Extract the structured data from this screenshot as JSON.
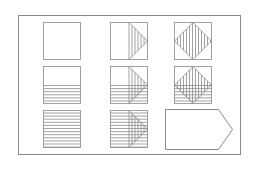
{
  "diagram": {
    "type": "pattern-matrix-puzzle",
    "stroke_color": "#8a8a8a",
    "frame": {
      "x": 18,
      "y": 15,
      "w": 222,
      "h": 139
    },
    "cells": [
      {
        "row": 0,
        "col": 0,
        "x": 43,
        "y": 22,
        "size": 37,
        "horizontal_lines": "none",
        "overlay": "none"
      },
      {
        "row": 0,
        "col": 1,
        "x": 110,
        "y": 22,
        "size": 37,
        "horizontal_lines": "none",
        "overlay": "triangle-right"
      },
      {
        "row": 0,
        "col": 2,
        "x": 174,
        "y": 22,
        "size": 37,
        "horizontal_lines": "none",
        "overlay": "diamond"
      },
      {
        "row": 1,
        "col": 0,
        "x": 43,
        "y": 66,
        "size": 37,
        "horizontal_lines": "bottom-half",
        "overlay": "none"
      },
      {
        "row": 1,
        "col": 1,
        "x": 110,
        "y": 66,
        "size": 37,
        "horizontal_lines": "bottom-half",
        "overlay": "triangle-right"
      },
      {
        "row": 1,
        "col": 2,
        "x": 174,
        "y": 66,
        "size": 37,
        "horizontal_lines": "bottom-half",
        "overlay": "diamond"
      },
      {
        "row": 2,
        "col": 0,
        "x": 43,
        "y": 110,
        "size": 37,
        "horizontal_lines": "full",
        "overlay": "none"
      },
      {
        "row": 2,
        "col": 1,
        "x": 110,
        "y": 110,
        "size": 37,
        "horizontal_lines": "full",
        "overlay": "triangle-right"
      }
    ],
    "answer_placeholder": {
      "row": 2,
      "col": 2,
      "shape": "pentagon-arrow",
      "x": 165,
      "y": 109,
      "w": 67,
      "h": 40,
      "tip_inset": 14
    }
  }
}
